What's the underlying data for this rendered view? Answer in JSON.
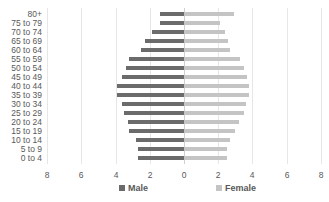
{
  "chart_data": {
    "type": "bar",
    "orientation": "horizontal",
    "subtype": "population-pyramid",
    "title": "",
    "xlabel": "",
    "ylabel": "",
    "categories": [
      "80+",
      "75 to 79",
      "70 to 74",
      "65 to 69",
      "60 to 64",
      "55 to 59",
      "50 to 54",
      "45 to 49",
      "40 to 44",
      "35 to 39",
      "30 to 34",
      "25 to 29",
      "20 to 24",
      "15 to 19",
      "10 to 14",
      "5 to 9",
      "0 to 4"
    ],
    "series": [
      {
        "name": "Male",
        "color": "#6b6b6b",
        "side": "left",
        "values": [
          1.4,
          1.4,
          1.9,
          2.3,
          2.5,
          3.2,
          3.4,
          3.6,
          3.9,
          3.9,
          3.6,
          3.5,
          3.3,
          3.2,
          2.8,
          2.7,
          2.7
        ]
      },
      {
        "name": "Female",
        "color": "#c4c4c4",
        "side": "right",
        "values": [
          2.9,
          2.1,
          2.4,
          2.6,
          2.7,
          3.3,
          3.5,
          3.7,
          3.8,
          3.8,
          3.6,
          3.5,
          3.2,
          3.0,
          2.7,
          2.5,
          2.5
        ]
      }
    ],
    "x_tick_labels": [
      "8",
      "6",
      "4",
      "2",
      "0",
      "2",
      "4",
      "6",
      "8"
    ],
    "xlim": [
      -8,
      8
    ],
    "grid": true,
    "legend_position": "bottom"
  },
  "legend": {
    "male_label": "Male",
    "female_label": "Female"
  }
}
